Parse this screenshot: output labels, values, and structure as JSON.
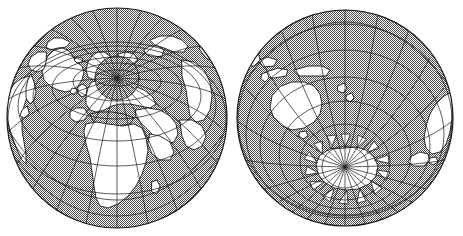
{
  "figure": {
    "kind": "two-hemisphere-globe-illustration",
    "background_color": "#ffffff",
    "line_color": "#1a1a1a",
    "ocean_fill": "dither-gray-50",
    "ocean_color": "#808080",
    "land_color": "#ffffff",
    "width": 463,
    "height": 236,
    "title": "",
    "caption": ""
  },
  "globes": [
    {
      "id": "northern-hemisphere",
      "name": "Northern Hemisphere",
      "projection": "azimuthal",
      "pole": "North Pole",
      "center_x": 117,
      "center_y": 118,
      "radius": 110,
      "pole_x": 117,
      "pole_y": 78,
      "graticule": {
        "parallel_spacing_deg": 15,
        "meridian_spacing_deg": 15,
        "parallels": [
          75,
          60,
          45,
          30,
          15,
          0,
          -15,
          -30
        ],
        "meridians": [
          0,
          15,
          30,
          45,
          60,
          75,
          90,
          105,
          120,
          135,
          150,
          165,
          180,
          195,
          210,
          225,
          240,
          255,
          270,
          285,
          300,
          315,
          330,
          345
        ]
      },
      "landmasses": [
        "Greenland",
        "North America",
        "Europe",
        "Africa",
        "Asia",
        "Arabia",
        "Scandinavia",
        "Iceland",
        "British Isles",
        "Mediterranean"
      ]
    },
    {
      "id": "southern-hemisphere",
      "name": "Southern Hemisphere",
      "projection": "azimuthal",
      "pole": "South Pole",
      "center_x": 345,
      "center_y": 118,
      "radius": 108,
      "pole_x": 345,
      "pole_y": 167,
      "graticule": {
        "parallel_spacing_deg": 15,
        "meridian_spacing_deg": 15,
        "parallels": [
          -75,
          -60,
          -45,
          -30,
          -15,
          0,
          15,
          30
        ],
        "meridians": [
          0,
          15,
          30,
          45,
          60,
          75,
          90,
          105,
          120,
          135,
          150,
          165,
          180,
          195,
          210,
          225,
          240,
          255,
          270,
          285,
          300,
          315,
          330,
          345
        ]
      },
      "landmasses": [
        "Antarctica",
        "Australia",
        "New Guinea",
        "New Zealand",
        "South America (southern tip)",
        "Africa (southern tip)",
        "Madagascar"
      ]
    }
  ]
}
